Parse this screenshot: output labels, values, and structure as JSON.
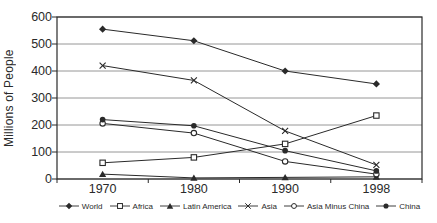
{
  "colors": {
    "ink": "#2a2a2a",
    "grid": "#8a8a8a",
    "background": "#ffffff"
  },
  "chart_data": {
    "type": "line",
    "title": "",
    "xlabel": "",
    "ylabel": "Millions of People",
    "categories": [
      "1970",
      "1980",
      "1990",
      "1998"
    ],
    "ylim": [
      0,
      600
    ],
    "ytick_step": 100,
    "ytick_labels": [
      "600",
      "500",
      "400",
      "300",
      "200",
      "100",
      "0"
    ],
    "grid": "horizontal",
    "legend_position": "bottom",
    "series": [
      {
        "name": "World",
        "marker": "diamond-filled",
        "color": "#2a2a2a",
        "values": [
          555,
          512,
          400,
          352
        ]
      },
      {
        "name": "Africa",
        "marker": "square-open",
        "color": "#2a2a2a",
        "values": [
          60,
          80,
          130,
          235
        ]
      },
      {
        "name": "Latin America",
        "marker": "triangle-filled",
        "color": "#2a2a2a",
        "values": [
          18,
          4,
          6,
          8
        ]
      },
      {
        "name": "Asia",
        "marker": "x",
        "color": "#2a2a2a",
        "values": [
          420,
          365,
          178,
          52
        ]
      },
      {
        "name": "Asia Minus China",
        "marker": "circle-open",
        "color": "#2a2a2a",
        "values": [
          206,
          170,
          65,
          18
        ]
      },
      {
        "name": "China",
        "marker": "circle-filled",
        "color": "#2a2a2a",
        "values": [
          220,
          197,
          105,
          30
        ]
      }
    ]
  }
}
